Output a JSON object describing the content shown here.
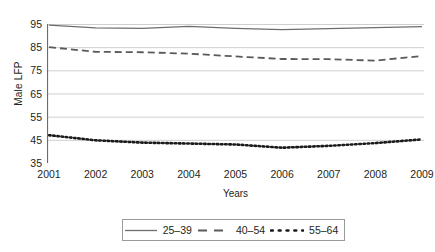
{
  "chart_data": {
    "type": "line",
    "title": "",
    "xlabel": "Years",
    "ylabel": "Male LFP",
    "x": [
      2001,
      2002,
      2003,
      2004,
      2005,
      2006,
      2007,
      2008,
      2009
    ],
    "xtick_labels": [
      "2001",
      "2002",
      "2003",
      "2004",
      "2005",
      "2006",
      "2007",
      "2008",
      "2009"
    ],
    "ytick_labels": [
      "95",
      "85",
      "75",
      "65",
      "55",
      "45",
      "35"
    ],
    "ylim": [
      35,
      95
    ],
    "xlim": [
      2001,
      2009
    ],
    "ytick_values": [
      95,
      85,
      75,
      65,
      55,
      45,
      35
    ],
    "grid": "horizontal",
    "legend_position": "bottom-outside",
    "series": [
      {
        "name": "25–39",
        "style": "solid",
        "color": "#6e6e6e",
        "values": [
          94.5,
          93.3,
          93.1,
          94.0,
          93.1,
          92.6,
          93.0,
          93.4,
          93.9
        ]
      },
      {
        "name": "40–54",
        "style": "dashed",
        "color": "#5a5a5a",
        "values": [
          85.0,
          83.0,
          82.8,
          82.2,
          81.0,
          79.9,
          79.8,
          79.2,
          81.2
        ]
      },
      {
        "name": "55–64",
        "style": "dotted",
        "color": "#1a1a1a",
        "values": [
          47.0,
          44.8,
          43.8,
          43.4,
          43.0,
          41.6,
          42.4,
          43.6,
          45.2
        ]
      }
    ]
  },
  "legend": {
    "items": [
      {
        "label": "25–39",
        "style": "solid"
      },
      {
        "label": "40–54",
        "style": "dashed"
      },
      {
        "label": "55–64",
        "style": "dotted"
      }
    ]
  },
  "colors": {
    "background": "#ffffff",
    "text": "#231f20",
    "gridline": "#c9c9c9",
    "axis": "#6b6b6b",
    "legend_border": "#9a9a9a"
  }
}
